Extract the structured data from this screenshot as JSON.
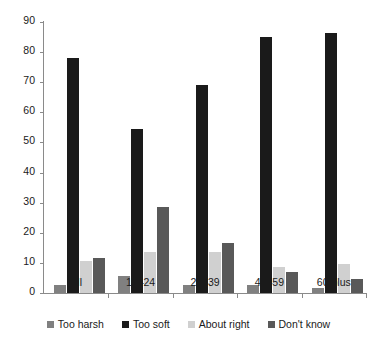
{
  "chart_data": {
    "type": "bar",
    "title": "",
    "subtitle": "",
    "xlabel": "",
    "ylabel": "",
    "categories": [
      "All",
      "18–24",
      "25–39",
      "40–59",
      "60 plus"
    ],
    "series": [
      {
        "name": "Too harsh",
        "color": "#808080",
        "values": [
          2.5,
          5.5,
          2.5,
          2.5,
          1.5
        ]
      },
      {
        "name": "Too soft",
        "color": "#1a1a1a",
        "values": [
          78,
          54.5,
          69,
          85,
          86.5
        ]
      },
      {
        "name": "About right",
        "color": "#d0d0d0",
        "values": [
          10.5,
          13.5,
          13.5,
          8.5,
          9.5
        ]
      },
      {
        "name": "Don't know",
        "color": "#595959",
        "values": [
          11.5,
          28.5,
          16.5,
          7,
          4.5
        ]
      }
    ],
    "ylim": [
      0,
      90
    ],
    "ytick_step": 10,
    "yticks": [
      0,
      10,
      20,
      30,
      40,
      50,
      60,
      70,
      80,
      90
    ],
    "ytick_labels": [
      "0",
      "10",
      "20",
      "30",
      "40",
      "50",
      "60",
      "70",
      "80",
      "90"
    ],
    "grid": false,
    "legend_position": "bottom",
    "axis_color": "#8a8a8a"
  }
}
